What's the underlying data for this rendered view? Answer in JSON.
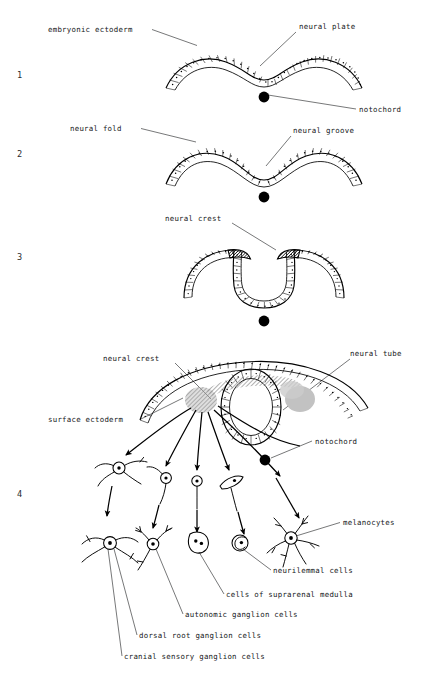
{
  "figure": {
    "stage_numbers": [
      "1",
      "2",
      "3",
      "4"
    ],
    "ink_color": "#000000",
    "background_color": "#ffffff",
    "crest_shade_color": "#b9b9b9",
    "crest_dark_color": "#1a1a1a"
  },
  "stage1": {
    "number": "1",
    "labels": {
      "embryonic_ectoderm": "embryonic ectoderm",
      "neural_plate": "neural plate",
      "notochord": "notochord"
    }
  },
  "stage2": {
    "number": "2",
    "labels": {
      "neural_fold": "neural fold",
      "neural_groove": "neural groove"
    }
  },
  "stage3": {
    "number": "3",
    "labels": {
      "neural_crest": "neural crest"
    }
  },
  "stage4": {
    "number": "4",
    "labels": {
      "neural_crest": "neural crest",
      "neural_tube": "neural tube",
      "surface_ectoderm": "surface ectoderm",
      "notochord": "notochord",
      "melanocytes": "melanocytes",
      "neurilemmal_cells": "neurilemmal cells",
      "cells_of_suprarenal_medulla": "cells of suprarenal medulla",
      "autonomic_ganglion_cells": "autonomic ganglion cells",
      "dorsal_root_ganglion_cells": "dorsal root ganglion cells",
      "cranial_sensory_ganglion_cells": "cranial sensory ganglion cells"
    },
    "derivatives": [
      "cranial sensory ganglion cells",
      "dorsal root ganglion cells",
      "autonomic ganglion cells",
      "cells of suprarenal medulla",
      "neurilemmal cells",
      "melanocytes"
    ]
  }
}
